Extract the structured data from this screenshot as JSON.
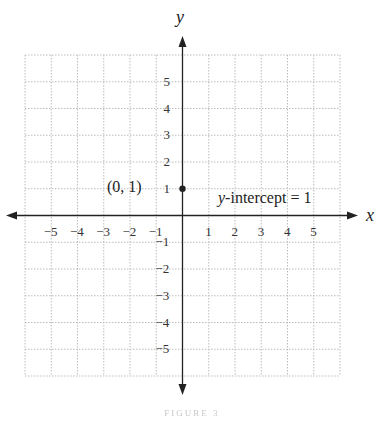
{
  "chart_data": {
    "type": "scatter",
    "title": "",
    "xlabel": "x",
    "ylabel": "y",
    "xlim": [
      -6,
      6
    ],
    "ylim": [
      -6,
      6
    ],
    "grid": true,
    "grid_style": "dotted",
    "x_ticks": [
      -5,
      -4,
      -3,
      -2,
      -1,
      1,
      2,
      3,
      4,
      5
    ],
    "y_ticks": [
      5,
      4,
      3,
      2,
      1,
      -1,
      -2,
      -3,
      -4,
      -5
    ],
    "series": [
      {
        "name": "y-intercept",
        "points": [
          {
            "x": 0,
            "y": 1
          }
        ]
      }
    ],
    "annotations": [
      {
        "text": "(0, 1)",
        "x": 0,
        "y": 1,
        "position": "left"
      },
      {
        "text": "y-intercept = 1",
        "x": 1.3,
        "y": 0.7,
        "position": "right"
      }
    ],
    "legend": null
  },
  "labels": {
    "x_axis": "x",
    "y_axis": "y",
    "point_label": "(0, 1)",
    "intercept_var": "y",
    "intercept_rest": "-intercept = 1",
    "caption": "FIGURE 3"
  },
  "colors": {
    "axis": "#222222",
    "grid": "#bdbdbd",
    "point": "#222222",
    "background": "#ffffff"
  }
}
